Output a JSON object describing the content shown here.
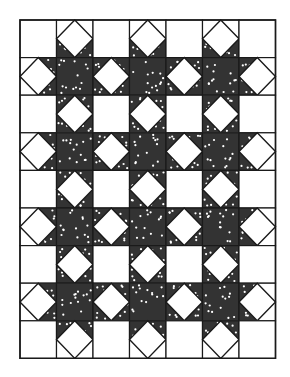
{
  "quilt": {
    "title": "Sawtooth Star quilt layout",
    "columns": 7,
    "rows": 9,
    "cell_width": 36.5,
    "cell_height": 37.6,
    "colors": {
      "background": "#ffffff",
      "dark_fabric": "#333333",
      "dots": "#ffffff",
      "outline": "#1a1a1a"
    },
    "block_types": {
      "even_row_even_col": "plain-square",
      "even_row_odd_col": "square-in-square-vertical-points",
      "odd_row_even_col": "square-in-square-horizontal-points",
      "odd_row_odd_col": "star-center-dotted"
    }
  }
}
